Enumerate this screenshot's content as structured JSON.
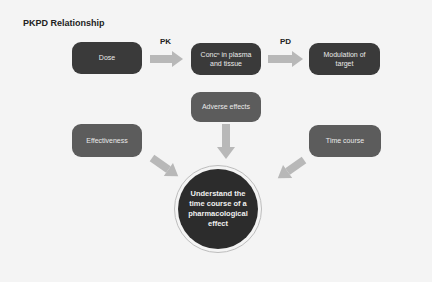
{
  "title": "PKPD Relationship",
  "labels": {
    "pk": "PK",
    "pd": "PD"
  },
  "boxes": {
    "dose": "Dose",
    "concentration": "Concⁿ in plasma and tissue",
    "modulation": "Modulation of target",
    "adverse": "Adverse effects",
    "effectiveness": "Effectiveness",
    "time_course": "Time course"
  },
  "center": "Understand the time course of a pharmacological effect",
  "colors": {
    "background": "#f4f4f4",
    "box_dark": "#3a3a3a",
    "box_medium": "#5c5c5c",
    "arrow": "#b8b8b8",
    "circle": "#2c2c2c"
  }
}
